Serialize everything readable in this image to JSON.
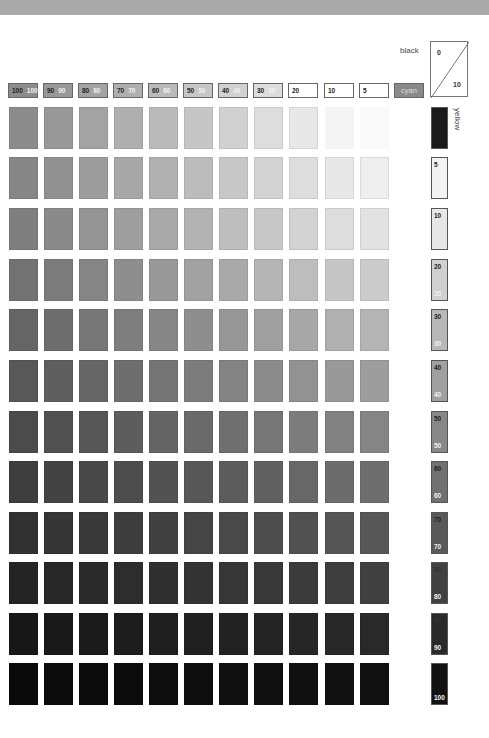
{
  "chart": {
    "title": "",
    "black_axis_label": "black",
    "yellow_axis_label": "yellow",
    "cyan_label": "cyan",
    "corner": {
      "top_value": "0",
      "bottom_value": "10"
    }
  },
  "columns": [
    {
      "label_a": "100",
      "label_b": "100",
      "c": 100
    },
    {
      "label_a": "90",
      "label_b": "90",
      "c": 90
    },
    {
      "label_a": "80",
      "label_b": "80",
      "c": 80
    },
    {
      "label_a": "70",
      "label_b": "70",
      "c": 70
    },
    {
      "label_a": "60",
      "label_b": "60",
      "c": 60
    },
    {
      "label_a": "50",
      "label_b": "50",
      "c": 50
    },
    {
      "label_a": "40",
      "label_b": "40",
      "c": 40
    },
    {
      "label_a": "30",
      "label_b": "30",
      "c": 30
    },
    {
      "label_a": "20",
      "label_b": "",
      "c": 20
    },
    {
      "label_a": "10",
      "label_b": "",
      "c": 10
    },
    {
      "label_a": "5",
      "label_b": "",
      "c": 5
    },
    {
      "label_a": "cyan",
      "label_b": "",
      "c": 0
    }
  ],
  "rows": [
    {
      "label_a": "",
      "label_b": "",
      "k": 0
    },
    {
      "label_a": "5",
      "label_b": "",
      "k": 5
    },
    {
      "label_a": "10",
      "label_b": "",
      "k": 10
    },
    {
      "label_a": "20",
      "label_b": "20",
      "k": 20
    },
    {
      "label_a": "30",
      "label_b": "30",
      "k": 30
    },
    {
      "label_a": "40",
      "label_b": "40",
      "k": 40
    },
    {
      "label_a": "50",
      "label_b": "50",
      "k": 50
    },
    {
      "label_a": "60",
      "label_b": "60",
      "k": 60
    },
    {
      "label_a": "70",
      "label_b": "70",
      "k": 70
    },
    {
      "label_a": "80",
      "label_b": "80",
      "k": 80
    },
    {
      "label_a": "90",
      "label_b": "90",
      "k": 90
    },
    {
      "label_a": "",
      "label_b": "100",
      "k": 100
    }
  ],
  "colors": {
    "top_band": "#a9a9a9",
    "cyan_box": "#8a8a8a",
    "first_row_label": "#1a1a1a"
  }
}
